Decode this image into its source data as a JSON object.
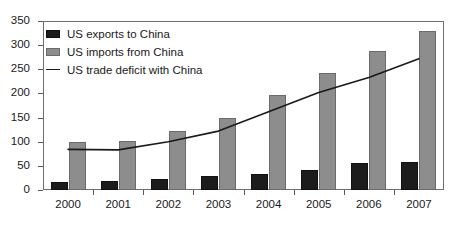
{
  "chart_data": {
    "type": "bar",
    "title": "",
    "subtitle": "",
    "xlabel": "",
    "ylabel": "",
    "categories": [
      "2000",
      "2001",
      "2002",
      "2003",
      "2004",
      "2005",
      "2006",
      "2007"
    ],
    "ylim": [
      0,
      350
    ],
    "ytick_labels": [
      "0",
      "50",
      "100",
      "150",
      "200",
      "250",
      "300",
      "350"
    ],
    "ytick_values": [
      0,
      50,
      100,
      150,
      200,
      250,
      300,
      350
    ],
    "grid": false,
    "legend_position": "top-left",
    "series": [
      {
        "name": "US exports to China",
        "type": "bar",
        "color": "#1c1c1c",
        "values": [
          16,
          19,
          22,
          28,
          34,
          41,
          55,
          58
        ]
      },
      {
        "name": "US imports from China",
        "type": "bar",
        "color": "#8d8d8d",
        "values": [
          100,
          102,
          122,
          150,
          196,
          243,
          288,
          330
        ]
      },
      {
        "name": "US trade deficit with China",
        "type": "line",
        "color": "#1a1a1a",
        "values": [
          84,
          83,
          100,
          122,
          162,
          202,
          233,
          272
        ]
      }
    ]
  },
  "legend": {
    "items": [
      {
        "label": "US exports to China",
        "swatch": "black-square-swatch"
      },
      {
        "label": "US imports from China",
        "swatch": "gray-square-swatch"
      },
      {
        "label": "US trade deficit with China",
        "swatch": "line-swatch"
      }
    ]
  }
}
